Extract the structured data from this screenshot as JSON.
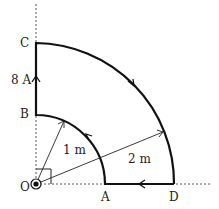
{
  "diagram": {
    "points": {
      "O": {
        "label": "O",
        "x": 36,
        "y": 184
      },
      "A": {
        "label": "A",
        "x": 105,
        "y": 184
      },
      "D": {
        "label": "D",
        "x": 174,
        "y": 184
      },
      "B": {
        "label": "B",
        "x": 36,
        "y": 115
      },
      "C": {
        "label": "C",
        "x": 36,
        "y": 43
      }
    },
    "current_label": "8 A",
    "inner_radius_label": "1 m",
    "outer_radius_label": "2 m",
    "colors": {
      "wire": "#111111",
      "guide": "#555555",
      "text": "#222222"
    }
  }
}
